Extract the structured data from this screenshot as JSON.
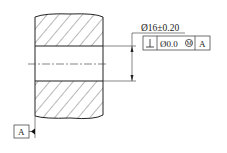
{
  "drawing": {
    "dimension_text": "Ø16±0.20",
    "fcf": {
      "symbol": "⊥",
      "tolerance": "Ø0.0",
      "modifier": "M",
      "datum": "A"
    },
    "datum_label": "A",
    "line_color": "#222222"
  }
}
